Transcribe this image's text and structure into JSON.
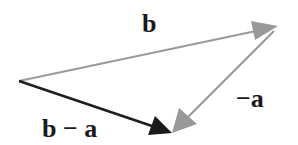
{
  "diagram": {
    "type": "vector-subtraction",
    "vectors": [
      {
        "id": "b",
        "label": "b",
        "from": [
          19,
          81
        ],
        "to": [
          277,
          26
        ],
        "color": "#9a9a9a"
      },
      {
        "id": "neg-a",
        "label": "−a",
        "from": [
          277,
          26
        ],
        "to": [
          172,
          133
        ],
        "color": "#9a9a9a"
      },
      {
        "id": "b-minus-a",
        "label": "b − a",
        "from": [
          19,
          81
        ],
        "to": [
          172,
          133
        ],
        "color": "#1e1e1e"
      }
    ]
  },
  "labels": {
    "b": "b",
    "neg_a": "−a",
    "b_minus_a": "b − a"
  },
  "colors": {
    "gray_vector": "#9a9a9a",
    "dark_vector": "#1e1e1e",
    "text": "#1a1a1a",
    "background": "#ffffff"
  }
}
